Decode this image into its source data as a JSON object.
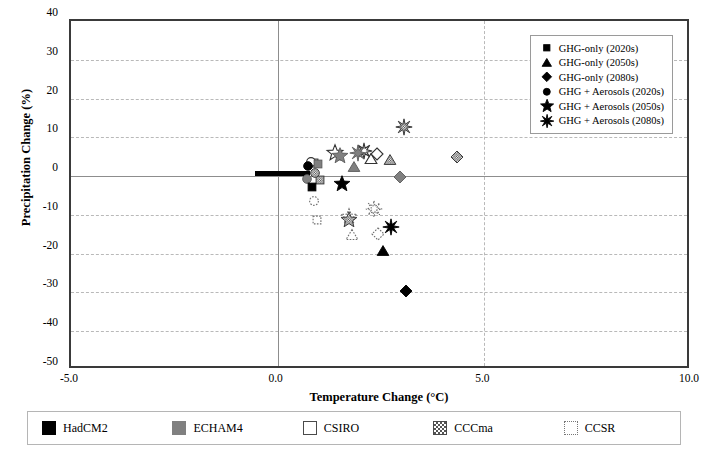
{
  "chart_data": {
    "type": "scatter",
    "title": "",
    "xlabel": "Temperature Change (°C)",
    "ylabel": "Precipitation Change (%)",
    "xlim": [
      -5.0,
      10.0
    ],
    "ylim": [
      -50,
      40
    ],
    "xticks": [
      "-5.0",
      "0.0",
      "5.0",
      "10.0"
    ],
    "xtick_values": [
      -5.0,
      0.0,
      5.0,
      10.0
    ],
    "yticks": [
      "40",
      "30",
      "20",
      "10",
      "0",
      "-10",
      "-20",
      "-30",
      "-40",
      "-50"
    ],
    "ytick_values": [
      40,
      30,
      20,
      10,
      0,
      -10,
      -20,
      -30,
      -40,
      -50
    ],
    "grid": "dashed horizontal and vertical gridlines",
    "legend_position": "top-right inside plot",
    "points": [
      {
        "model": "HadCM2",
        "scenario": "GHG-only (2020s)",
        "marker": "square",
        "fill": "black",
        "x": 0.82,
        "y": -2.8
      },
      {
        "model": "HadCM2",
        "scenario": "GHG-only (2050s)",
        "marker": "triangle",
        "fill": "black",
        "x": 2.55,
        "y": -19.3
      },
      {
        "model": "HadCM2",
        "scenario": "GHG-only (2080s)",
        "marker": "diamond",
        "fill": "black",
        "x": 3.1,
        "y": -29.5
      },
      {
        "model": "HadCM2",
        "scenario": "GHG + Aerosols (2020s)",
        "marker": "circle",
        "fill": "black",
        "x": 0.73,
        "y": 2.6
      },
      {
        "model": "HadCM2",
        "scenario": "GHG + Aerosols (2050s)",
        "marker": "star5",
        "fill": "black",
        "x": 1.55,
        "y": -2.1
      },
      {
        "model": "HadCM2",
        "scenario": "GHG + Aerosols (2080s)",
        "marker": "star8",
        "fill": "black",
        "x": 2.75,
        "y": -13.0
      },
      {
        "model": "ECHAM4",
        "scenario": "GHG-only (2020s)",
        "marker": "square",
        "fill": "gray",
        "x": 0.98,
        "y": 3.0
      },
      {
        "model": "ECHAM4",
        "scenario": "GHG-only (2050s)",
        "marker": "triangle",
        "fill": "gray",
        "x": 1.85,
        "y": 2.3
      },
      {
        "model": "ECHAM4",
        "scenario": "GHG-only (2080s)",
        "marker": "diamond",
        "fill": "gray",
        "x": 2.95,
        "y": -0.3
      },
      {
        "model": "ECHAM4",
        "scenario": "GHG + Aerosols (2020s)",
        "marker": "circle",
        "fill": "gray",
        "x": 0.72,
        "y": -0.7
      },
      {
        "model": "ECHAM4",
        "scenario": "GHG + Aerosols (2050s)",
        "marker": "star5",
        "fill": "gray",
        "x": 1.5,
        "y": 5.3
      },
      {
        "model": "ECHAM4",
        "scenario": "GHG + Aerosols (2080s)",
        "marker": "star8",
        "fill": "gray",
        "x": 1.95,
        "y": 5.9
      },
      {
        "model": "CSIRO",
        "scenario": "GHG-only (2020s)",
        "marker": "square",
        "fill": "white",
        "x": 0.88,
        "y": 3.5
      },
      {
        "model": "CSIRO",
        "scenario": "GHG-only (2050s)",
        "marker": "triangle",
        "fill": "white",
        "x": 2.25,
        "y": 4.4
      },
      {
        "model": "CSIRO",
        "scenario": "GHG-only (2080s)",
        "marker": "diamond",
        "fill": "white",
        "x": 2.4,
        "y": 5.6
      },
      {
        "model": "CSIRO",
        "scenario": "GHG + Aerosols (2020s)",
        "marker": "circle",
        "fill": "white",
        "x": 0.8,
        "y": 3.6
      },
      {
        "model": "CSIRO",
        "scenario": "GHG + Aerosols (2050s)",
        "marker": "star5",
        "fill": "white",
        "x": 1.38,
        "y": 5.9
      },
      {
        "model": "CSIRO",
        "scenario": "GHG + Aerosols (2080s)",
        "marker": "star8",
        "fill": "white",
        "x": 2.1,
        "y": 6.4
      },
      {
        "model": "CCCma",
        "scenario": "GHG-only (2020s)",
        "marker": "square",
        "fill": "hatch",
        "x": 1.02,
        "y": -0.9
      },
      {
        "model": "CCCma",
        "scenario": "GHG-only (2050s)",
        "marker": "triangle",
        "fill": "hatch",
        "x": 2.72,
        "y": 4.2
      },
      {
        "model": "CCCma",
        "scenario": "GHG-only (2080s)",
        "marker": "diamond",
        "fill": "hatch",
        "x": 4.35,
        "y": 4.8
      },
      {
        "model": "CCCma",
        "scenario": "GHG + Aerosols (2020s)",
        "marker": "circle",
        "fill": "hatch",
        "x": 0.9,
        "y": 0.9
      },
      {
        "model": "CCCma",
        "scenario": "GHG + Aerosols (2050s)",
        "marker": "star5",
        "fill": "hatch",
        "x": 1.72,
        "y": -11.2
      },
      {
        "model": "CCCma",
        "scenario": "GHG + Aerosols (2080s)",
        "marker": "star8",
        "fill": "hatch",
        "x": 3.05,
        "y": 12.7
      },
      {
        "model": "CCSR",
        "scenario": "GHG-only (2020s)",
        "marker": "square",
        "fill": "dotted",
        "x": 0.95,
        "y": -11.4
      },
      {
        "model": "CCSR",
        "scenario": "GHG-only (2050s)",
        "marker": "triangle",
        "fill": "dotted",
        "x": 1.8,
        "y": -15.2
      },
      {
        "model": "CCSR",
        "scenario": "GHG-only (2080s)",
        "marker": "diamond",
        "fill": "dotted",
        "x": 2.42,
        "y": -14.8
      },
      {
        "model": "CCSR",
        "scenario": "GHG + Aerosols (2020s)",
        "marker": "circle",
        "fill": "dotted",
        "x": 0.88,
        "y": -6.3
      },
      {
        "model": "CCSR",
        "scenario": "GHG + Aerosols (2050s)",
        "marker": "star5",
        "fill": "dotted",
        "x": 1.72,
        "y": -10.6
      },
      {
        "model": "CCSR",
        "scenario": "GHG + Aerosols (2080s)",
        "marker": "star8",
        "fill": "dotted",
        "x": 2.32,
        "y": -8.6
      }
    ],
    "baseline_bar": {
      "x_start": -0.55,
      "x_end": 0.78,
      "y": 0.6,
      "color": "#000000",
      "note": "thick black horizontal reference bar near zero"
    }
  },
  "plot_legend": {
    "items": [
      {
        "symbol": "square",
        "label": "GHG-only (2020s)"
      },
      {
        "symbol": "triangle",
        "label": "GHG-only (2050s)"
      },
      {
        "symbol": "diamond",
        "label": "GHG-only (2080s)"
      },
      {
        "symbol": "circle",
        "label": "GHG + Aerosols (2020s)"
      },
      {
        "symbol": "star5",
        "label": "GHG + Aerosols (2050s)"
      },
      {
        "symbol": "star8",
        "label": "GHG + Aerosols (2080s)"
      }
    ]
  },
  "model_legend": {
    "items": [
      {
        "label": "HadCM2",
        "swatch": "solid-black",
        "color": "#000000"
      },
      {
        "label": "ECHAM4",
        "swatch": "solid-gray",
        "color": "#808080"
      },
      {
        "label": "CSIRO",
        "swatch": "open-white",
        "color": "#ffffff"
      },
      {
        "label": "CCCma",
        "swatch": "checkered",
        "color": "#555555"
      },
      {
        "label": "CCSR",
        "swatch": "dotted-outline",
        "color": "#777777"
      }
    ]
  }
}
